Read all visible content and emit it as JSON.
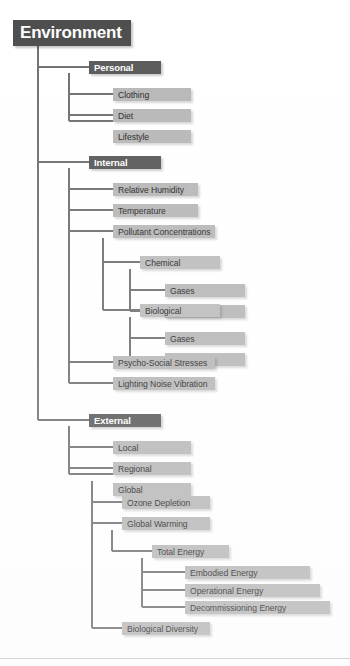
{
  "diagram": {
    "title": "Environment",
    "type": "hierarchical-tree",
    "line_color": "#707070",
    "root_box_color": "#4d4d4d",
    "level2_box_color": "#595959",
    "leaf_box_color": "#b7b7b7",
    "root_text_color": "#ffffff",
    "leaf_text_color": "#262626",
    "background_color": "#ffffff"
  },
  "nodes": {
    "root": "Environment",
    "personal": "Personal",
    "personal_children": [
      "Clothing",
      "Diet",
      "Lifestyle"
    ],
    "internal": "Internal",
    "internal_children": [
      "Relative Humidity",
      "Temperature",
      "Pollutant Concentrations",
      "Psycho-Social Stresses",
      "Lighting Noise Vibration"
    ],
    "chemical": "Chemical",
    "chemical_children": [
      "Gases",
      "Particulates"
    ],
    "biological": "Biological",
    "biological_children": [
      "Gases",
      "Particulates"
    ],
    "external": "External",
    "external_children": [
      "Local",
      "Regional",
      "Global"
    ],
    "global_children": [
      "Ozone Depletion",
      "Global Warming",
      "Biological Diversity"
    ],
    "total_energy": "Total Energy",
    "total_energy_children": [
      "Embodied Energy",
      "Operational Energy",
      "Decommissioning Energy"
    ]
  }
}
